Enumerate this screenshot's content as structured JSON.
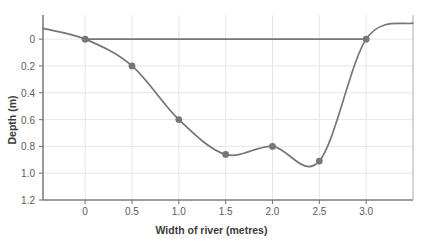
{
  "chart_data": {
    "type": "line",
    "title": "",
    "xlabel": "Width of river (metres)",
    "ylabel": "Depth (m)",
    "x": [
      0,
      0.5,
      1.0,
      1.5,
      2.0,
      2.5,
      3.0
    ],
    "values": [
      0,
      0.2,
      0.6,
      0.86,
      0.8,
      0.91,
      0
    ],
    "series": [
      {
        "name": "River bed profile",
        "x": [
          0,
          0.5,
          1.0,
          1.5,
          2.0,
          2.5,
          3.0
        ],
        "values": [
          0,
          0.2,
          0.6,
          0.86,
          0.8,
          0.91,
          0
        ]
      },
      {
        "name": "Water surface",
        "x": [
          0,
          3.0
        ],
        "values": [
          0,
          0
        ]
      }
    ],
    "xlim": [
      -0.45,
      3.5
    ],
    "ylim": [
      -0.18,
      1.2
    ],
    "y_inverted": true,
    "xticks": [
      0,
      0.5,
      1.0,
      1.5,
      2.0,
      2.5,
      3.0
    ],
    "xtick_labels": [
      "0",
      "0.5",
      "1.0",
      "1.5",
      "2.0",
      "2.5",
      "3.0"
    ],
    "yticks": [
      0,
      0.2,
      0.4,
      0.6,
      0.8,
      1.0,
      1.2
    ],
    "ytick_labels": [
      "0",
      "0.2",
      "0.4",
      "0.6",
      "0.8",
      "1.0",
      "1.2"
    ],
    "grid": true,
    "legend": "none",
    "bank_extension": {
      "left_x": -0.45,
      "left_depth": -0.08,
      "right_x": 3.5,
      "right_depth": -0.12
    },
    "colors": {
      "line": "#767676",
      "marker": "#767676",
      "grid": "#e6e6e6",
      "axis": "#808080",
      "tick_text": "#5a5a5a",
      "title_text": "#3b3b3b",
      "background": "#ffffff"
    }
  }
}
